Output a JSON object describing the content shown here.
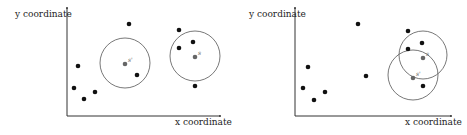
{
  "panels": [
    {
      "id": "left",
      "y_label": "y coordinate",
      "x_label": "x coordinate",
      "axis": {
        "x0": 67,
        "y0": 116,
        "x_end": 220,
        "y_top": 8
      },
      "ylabel_pos": [
        15,
        17
      ],
      "xlabel_pos": [
        175,
        125
      ],
      "points": [
        {
          "x": 78,
          "y": 66,
          "type": "black"
        },
        {
          "x": 74,
          "y": 88,
          "type": "black"
        },
        {
          "x": 84,
          "y": 99,
          "type": "black"
        },
        {
          "x": 95,
          "y": 92,
          "type": "black"
        },
        {
          "x": 129,
          "y": 24,
          "type": "black"
        },
        {
          "x": 137,
          "y": 75,
          "type": "black"
        },
        {
          "x": 179,
          "y": 30,
          "type": "black"
        },
        {
          "x": 179,
          "y": 48,
          "type": "black"
        },
        {
          "x": 193,
          "y": 42,
          "type": "black"
        },
        {
          "x": 195,
          "y": 86,
          "type": "black"
        },
        {
          "x": 125,
          "y": 64,
          "type": "gray",
          "label": "s'"
        },
        {
          "x": 195,
          "y": 57,
          "type": "gray",
          "label": "s"
        }
      ],
      "circles": [
        {
          "cx": 125,
          "cy": 63,
          "r": 25
        },
        {
          "cx": 195,
          "cy": 56,
          "r": 25
        }
      ]
    },
    {
      "id": "right",
      "y_label": "y coordinate",
      "x_label": "x coordinate",
      "axis": {
        "x0": 295,
        "y0": 116,
        "x_end": 451,
        "y_top": 8
      },
      "ylabel_pos": [
        249,
        17
      ],
      "xlabel_pos": [
        405,
        125
      ],
      "points": [
        {
          "x": 308,
          "y": 67,
          "type": "black"
        },
        {
          "x": 303,
          "y": 88,
          "type": "black"
        },
        {
          "x": 314,
          "y": 100,
          "type": "black"
        },
        {
          "x": 325,
          "y": 92,
          "type": "black"
        },
        {
          "x": 358,
          "y": 24,
          "type": "black"
        },
        {
          "x": 366,
          "y": 76,
          "type": "black"
        },
        {
          "x": 408,
          "y": 31,
          "type": "black"
        },
        {
          "x": 422,
          "y": 43,
          "type": "black"
        },
        {
          "x": 408,
          "y": 49,
          "type": "black"
        },
        {
          "x": 423,
          "y": 86,
          "type": "black"
        },
        {
          "x": 423,
          "y": 58,
          "type": "gray",
          "label": "s"
        },
        {
          "x": 413,
          "y": 78,
          "type": "gray",
          "label": "s'"
        }
      ],
      "circles": [
        {
          "cx": 423,
          "cy": 55,
          "r": 24
        },
        {
          "cx": 413,
          "cy": 75,
          "r": 25
        }
      ]
    }
  ],
  "colors": {
    "point_black": "#111111",
    "point_gray": "#666666",
    "circle": "#555555",
    "axis": "#333333"
  }
}
